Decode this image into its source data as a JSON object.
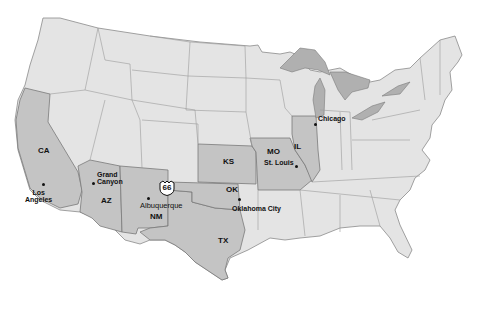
{
  "map": {
    "title": "Route 66 states map",
    "highlight_color": "#c4c4c4",
    "base_color": "#e4e4e4",
    "lake_color": "#b0b0b0",
    "states": [
      {
        "abbr": "CA"
      },
      {
        "abbr": "AZ"
      },
      {
        "abbr": "NM"
      },
      {
        "abbr": "TX"
      },
      {
        "abbr": "OK"
      },
      {
        "abbr": "KS"
      },
      {
        "abbr": "MO"
      },
      {
        "abbr": "IL"
      }
    ],
    "cities": [
      {
        "name": "Los\nAngeles",
        "line1": "Los",
        "line2": "Angeles"
      },
      {
        "name": "Grand Canyon",
        "line1": "Grand",
        "line2": "Canyon"
      },
      {
        "name": "Albuquerque"
      },
      {
        "name": "Oklahoma City"
      },
      {
        "name": "St. Louis"
      },
      {
        "name": "Chicago"
      }
    ],
    "route_shield": "66"
  }
}
